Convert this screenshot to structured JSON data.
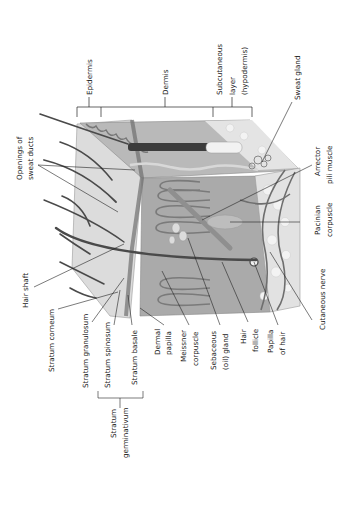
{
  "figure": {
    "orientation": "rotated-90-ccw",
    "palette": {
      "background": "#ffffff",
      "epidermis_surface": "#d9d9d9",
      "dermis": "#a9a9a9",
      "dermis_dark": "#8c8c8c",
      "hypodermis": "#e6e6e6",
      "hair": "#4a4a4a",
      "leader_line": "#222222",
      "text": "#222222"
    }
  },
  "layers": {
    "epidermis": "Epidermis",
    "dermis": "Dermis",
    "subcutaneous_line1": "Subcutaneous",
    "subcutaneous_line2": "layer",
    "subcutaneous_line3": "(hypodermis)"
  },
  "labels": {
    "openings_line1": "Openings of",
    "openings_line2": "sweat ducts",
    "sweat_gland": "Sweat gland",
    "arrector_line1": "Arrector",
    "arrector_line2": "pili muscle",
    "pacinian_line1": "Pacinian",
    "pacinian_line2": "corpuscle",
    "cutaneous_nerve": "Cutaneous nerve",
    "hair_shaft": "Hair shaft",
    "stratum_corneum": "Stratum corneum",
    "stratum_granulosum": "Stratum granulosum",
    "stratum_spinosum": "Stratum spinosum",
    "stratum_basale": "Stratum basale",
    "germinativum_line1": "Stratum",
    "germinativum_line2": "germinativum",
    "dermal_line1": "Dermal",
    "dermal_line2": "papilla",
    "meissner_line1": "Meissner",
    "meissner_line2": "corpuscle",
    "sebaceous_line1": "Sebaceous",
    "sebaceous_line2": "(oil) gland",
    "follicle_line1": "Hair",
    "follicle_line2": "follicle",
    "papilla_hair_line1": "Papilla",
    "papilla_hair_line2": "of hair"
  }
}
